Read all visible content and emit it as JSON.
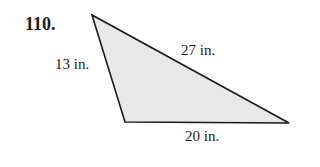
{
  "problem": {
    "number": "110.",
    "shape": "triangle",
    "sides": {
      "left": "13 in.",
      "hypotenuse": "27 in.",
      "bottom": "20 in."
    },
    "fill_color": "#e8e8e8",
    "stroke_color": "#1a1a1a"
  }
}
